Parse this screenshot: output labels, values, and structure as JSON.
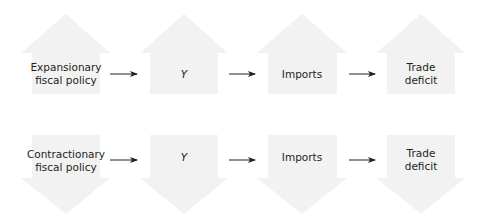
{
  "colors": {
    "block_fill": "#f2f2f2",
    "connector": "#231f20",
    "text": "#231f20",
    "background": "#ffffff"
  },
  "rows": [
    {
      "direction": "up",
      "nodes": [
        {
          "label_line1": "Expansionary",
          "label_line2": "fiscal policy"
        },
        {
          "label_line1": "Y",
          "label_line2": ""
        },
        {
          "label_line1": "Imports",
          "label_line2": ""
        },
        {
          "label_line1": "Trade",
          "label_line2": "deficit"
        }
      ]
    },
    {
      "direction": "down",
      "nodes": [
        {
          "label_line1": "Contractionary",
          "label_line2": "fiscal policy"
        },
        {
          "label_line1": "Y",
          "label_line2": ""
        },
        {
          "label_line1": "Imports",
          "label_line2": ""
        },
        {
          "label_line1": "Trade",
          "label_line2": "deficit"
        }
      ]
    }
  ]
}
